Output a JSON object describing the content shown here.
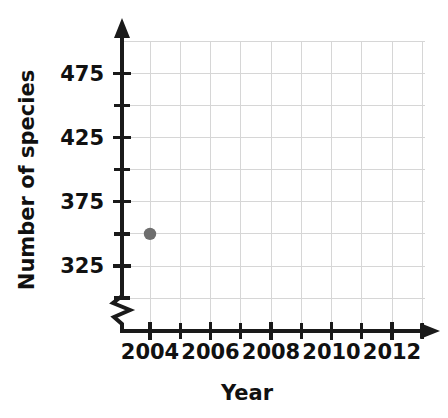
{
  "chart_data": {
    "type": "scatter",
    "title": "",
    "xlabel": "Year",
    "ylabel": "Number of species",
    "xlim": [
      2003.5,
      2013.5
    ],
    "ylim": [
      295,
      500
    ],
    "grid": true,
    "legend": false,
    "x_tick_labels": [
      "2004",
      "2006",
      "2008",
      "2010",
      "2012"
    ],
    "x_tick_values": [
      2004,
      2006,
      2008,
      2010,
      2012
    ],
    "x_minor_tick_values": [
      2005,
      2007,
      2009,
      2011,
      2013
    ],
    "y_tick_labels": [
      "475",
      "425",
      "375",
      "325"
    ],
    "y_tick_values": [
      475,
      425,
      375,
      325
    ],
    "y_minor_tick_values": [
      450,
      400,
      350,
      300
    ],
    "y_gridline_values": [
      500,
      475,
      450,
      425,
      400,
      375,
      350,
      325,
      300
    ],
    "x_gridline_values": [
      2004,
      2005,
      2006,
      2007,
      2008,
      2009,
      2010,
      2011,
      2012,
      2013
    ],
    "axis_break_y": true,
    "points": [
      {
        "x": 2004,
        "y": 350
      }
    ],
    "marker_color": "#6e6e6e",
    "axis_color": "#1a1a1a",
    "grid_color": "#d6d6d6"
  }
}
